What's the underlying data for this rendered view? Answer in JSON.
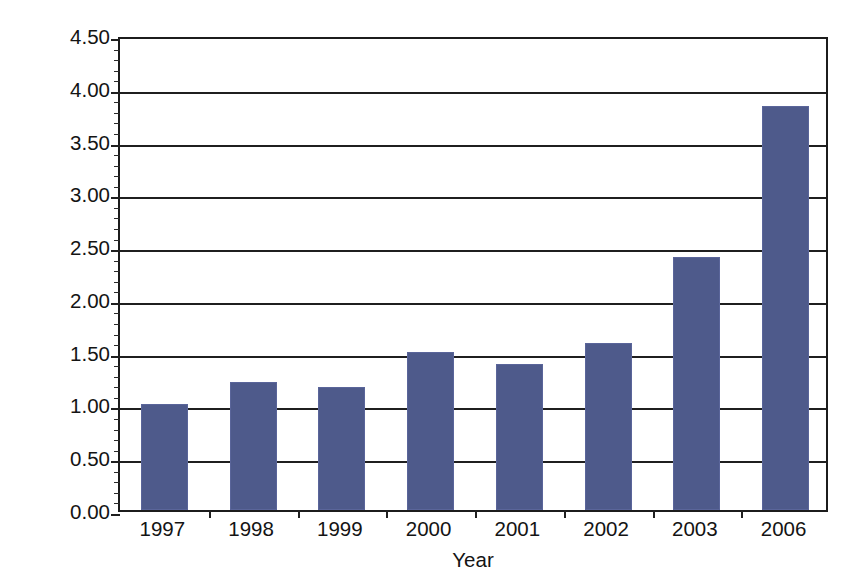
{
  "chart_data": {
    "type": "bar",
    "title": "",
    "xlabel": "Year",
    "ylabel": "Ratio of pitch to stall designs",
    "categories": [
      "1997",
      "1998",
      "1999",
      "2000",
      "2001",
      "2002",
      "2003",
      "2006"
    ],
    "values": [
      1.0,
      1.21,
      1.17,
      1.5,
      1.38,
      1.58,
      2.4,
      3.83
    ],
    "series": [
      {
        "name": "Ratio of pitch to stall designs",
        "values": [
          1.0,
          1.21,
          1.17,
          1.5,
          1.38,
          1.58,
          2.4,
          3.83
        ]
      }
    ],
    "ylim": [
      0.0,
      4.5
    ],
    "ytick_values": [
      0.0,
      0.5,
      1.0,
      1.5,
      2.0,
      2.5,
      3.0,
      3.5,
      4.0,
      4.5
    ],
    "ytick_labels": [
      "0.00",
      "0.50",
      "1.00",
      "1.50",
      "2.00",
      "2.50",
      "3.00",
      "3.50",
      "4.00",
      "4.50"
    ],
    "ytick_minor_step": 0.1,
    "grid": "horizontal",
    "legend": "none",
    "bar_color": "#4e5a8b",
    "axis_color": "#1f1f1f",
    "background_color": "#ffffff",
    "annotations": []
  },
  "axes": {
    "y_title": "Ratio of pitch to stall designs",
    "x_title": "Year"
  }
}
